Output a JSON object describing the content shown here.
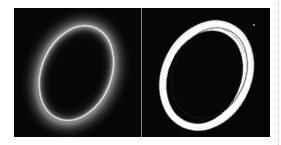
{
  "figure": {
    "panels": [
      {
        "name": "soft-ring",
        "description": "blurred glowing elliptical ring",
        "background": "#060606",
        "ring_color": "#e8e8e8",
        "center": [
          62,
          66
        ],
        "radii": [
          36,
          50
        ],
        "rotation_deg": 22
      },
      {
        "name": "thresholded-ring",
        "description": "sharp white elliptical ring",
        "background": "#060606",
        "ring_color": "#ffffff",
        "center": [
          64,
          68
        ],
        "radii": [
          40,
          52
        ],
        "rotation_deg": 24
      }
    ],
    "divider_color": "#8a8a8a"
  }
}
